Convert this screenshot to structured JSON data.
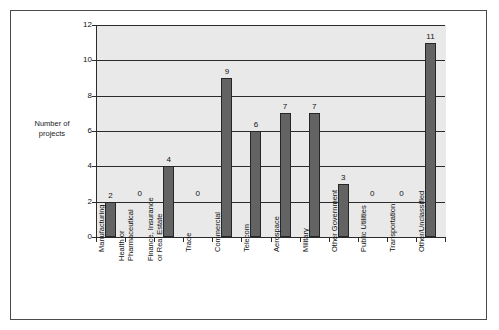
{
  "figure": {
    "frame_border_color": "#4a4a4a",
    "page_background": "#ffffff"
  },
  "chart_data": {
    "type": "bar",
    "title": "",
    "xlabel": "",
    "ylabel": "Number of\nprojects",
    "ylim": [
      0,
      12
    ],
    "ytick_values": [
      "0",
      "2",
      "4",
      "6",
      "8",
      "10",
      "12"
    ],
    "grid": true,
    "legend": "none",
    "plot_background": "#e9e9e9",
    "bar_fill_color": "#636363",
    "bar_edge_color": "#262626",
    "axis_color": "#2b2b2b",
    "show_value_labels": true,
    "categories": [
      "Manufacturing",
      "Health or\nPharmaceutical",
      "Finance, Insurance\nor Real Estate",
      "Trade",
      "Commercial",
      "Telecom",
      "Aerospace",
      "Military",
      "Other Government",
      "Public Utilities",
      "Transportation",
      "Other/Unclassified"
    ],
    "values": [
      2,
      0,
      4,
      0,
      9,
      6,
      7,
      7,
      3,
      0,
      0,
      11
    ],
    "value_labels": [
      "2",
      "0",
      "4",
      "0",
      "9",
      "6",
      "7",
      "7",
      "3",
      "0",
      "0",
      "11"
    ]
  }
}
